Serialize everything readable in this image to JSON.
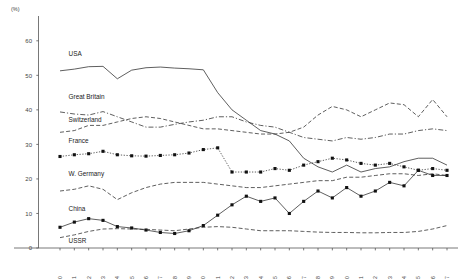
{
  "chart_data": {
    "type": "line",
    "title": "",
    "xlabel": "",
    "ylabel": "(%)",
    "yunit": "(%)",
    "ylim": [
      0,
      60
    ],
    "yticks": [
      0,
      10,
      20,
      30,
      40,
      50,
      60
    ],
    "xlim": [
      1960,
      1987
    ],
    "grid": false,
    "legend": "inline-left-labels",
    "categories": [
      1960,
      1961,
      1962,
      1963,
      1964,
      1965,
      1966,
      1967,
      1968,
      1969,
      1970,
      1971,
      1972,
      1973,
      1974,
      1975,
      1976,
      1977,
      1978,
      1979,
      1980,
      1981,
      1982,
      1983,
      1984,
      1985,
      1986,
      1987
    ],
    "xticklabels": [
      "1960",
      "1961",
      "1962",
      "1963",
      "1964",
      "1965",
      "1966",
      "1967",
      "1968",
      "1969",
      "1970",
      "1971",
      "1972",
      "1973",
      "1974",
      "1975",
      "1976",
      "1977",
      "1978",
      "1979",
      "1980",
      "1981",
      "1982",
      "1983",
      "1984",
      "1985",
      "1986",
      "1987"
    ],
    "series": [
      {
        "name": "USA",
        "label": "USA",
        "style": "solid",
        "marker": "none",
        "values": [
          51.3,
          51.8,
          52.5,
          52.6,
          49.0,
          51.5,
          52.2,
          52.4,
          52.1,
          51.9,
          51.6,
          45.0,
          40.0,
          37.0,
          34.0,
          33.0,
          31.0,
          26.0,
          23.5,
          22.0,
          24.0,
          22.0,
          23.0,
          23.5,
          25.0,
          26.0,
          26.0,
          24.0
        ]
      },
      {
        "name": "Great Britain",
        "label": "Great Britain",
        "style": "dashdot",
        "marker": "none",
        "values": [
          39.4,
          38.8,
          38.5,
          39.5,
          38.0,
          36.5,
          35.0,
          35.0,
          35.8,
          36.5,
          37.0,
          38.0,
          38.0,
          36.5,
          35.5,
          35.0,
          33.5,
          32.0,
          31.5,
          31.0,
          32.0,
          31.5,
          32.0,
          33.0,
          33.0,
          34.0,
          34.5,
          34.0
        ]
      },
      {
        "name": "Switzerland",
        "label": "Switzerland",
        "style": "dash",
        "marker": "none",
        "values": [
          33.5,
          34.0,
          35.5,
          35.5,
          36.5,
          37.5,
          38.0,
          37.5,
          36.5,
          35.5,
          34.5,
          34.5,
          34.0,
          33.5,
          33.0,
          33.0,
          33.5,
          35.0,
          38.5,
          41.0,
          40.0,
          38.0,
          40.0,
          42.0,
          41.5,
          38.0,
          43.0,
          38.0
        ]
      },
      {
        "name": "France",
        "label": "France",
        "style": "dot",
        "marker": "square",
        "values": [
          26.5,
          27.0,
          27.3,
          28.0,
          27.0,
          26.7,
          26.6,
          26.8,
          27.0,
          27.5,
          28.5,
          29.0,
          22.0,
          22.0,
          22.0,
          23.0,
          22.5,
          24.0,
          25.0,
          26.0,
          25.5,
          24.5,
          24.0,
          24.5,
          23.5,
          22.5,
          23.0,
          22.5
        ]
      },
      {
        "name": "W. Germany",
        "label": "W. Germany",
        "style": "dash",
        "marker": "none",
        "values": [
          16.5,
          17.0,
          18.0,
          17.0,
          14.0,
          16.0,
          17.5,
          18.5,
          19.0,
          19.0,
          19.0,
          18.5,
          18.0,
          17.5,
          17.5,
          18.0,
          18.5,
          19.0,
          19.5,
          19.5,
          20.5,
          20.5,
          21.0,
          21.5,
          21.5,
          21.0,
          21.5,
          21.0
        ]
      },
      {
        "name": "China",
        "label": "China",
        "style": "solid",
        "marker": "square",
        "values": [
          6.0,
          7.5,
          8.5,
          8.0,
          6.2,
          5.8,
          5.2,
          4.5,
          4.2,
          5.0,
          6.5,
          9.5,
          12.5,
          15.0,
          13.5,
          14.5,
          10.0,
          13.5,
          16.5,
          14.5,
          17.5,
          15.0,
          16.5,
          19.0,
          18.0,
          22.5,
          21.0,
          21.0
        ]
      },
      {
        "name": "USSR",
        "label": "USSR",
        "style": "dash",
        "marker": "none",
        "values": [
          3.0,
          3.8,
          4.8,
          5.5,
          5.6,
          5.5,
          5.4,
          5.2,
          5.0,
          5.5,
          6.0,
          6.2,
          6.0,
          5.5,
          5.0,
          5.0,
          5.0,
          4.8,
          4.6,
          4.5,
          4.5,
          4.4,
          4.4,
          4.5,
          4.5,
          4.8,
          5.5,
          6.5
        ]
      }
    ],
    "series_labels_on_plot": [
      {
        "text": "USA",
        "x_year": 1960.6,
        "y_value": 55.6
      },
      {
        "text": "Great Britain",
        "x_year": 1960.6,
        "y_value": 43.2
      },
      {
        "text": "Switzerland",
        "x_year": 1960.6,
        "y_value": 36.6
      },
      {
        "text": "France",
        "x_year": 1960.6,
        "y_value": 30.4
      },
      {
        "text": "W. Germany",
        "x_year": 1960.6,
        "y_value": 20.9
      },
      {
        "text": "China",
        "x_year": 1960.6,
        "y_value": 10.7
      },
      {
        "text": "USSR",
        "x_year": 1960.6,
        "y_value": 1.4
      }
    ]
  }
}
